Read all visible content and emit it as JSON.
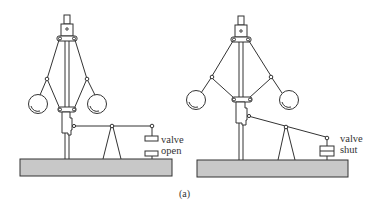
{
  "figure": {
    "caption": "(a)",
    "left_panel": {
      "state": "open",
      "valve_label_line1": "valve",
      "valve_label_line2": "open"
    },
    "right_panel": {
      "state": "shut",
      "valve_label_line1": "valve",
      "valve_label_line2": "shut"
    },
    "colors": {
      "line": "#333333",
      "base_fill": "#c8c8c8",
      "background": "#ffffff"
    }
  }
}
